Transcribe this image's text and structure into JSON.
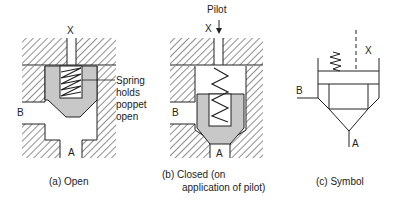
{
  "figures": [
    {
      "id": "a",
      "caption": "(a)  Open",
      "port_labels": {
        "x": "X",
        "b": "B",
        "a": "A"
      },
      "annotation_lines": [
        "Spring",
        "holds",
        "poppet",
        "open"
      ]
    },
    {
      "id": "b",
      "caption_lines": [
        "(b)  Closed (on",
        "application of pilot)"
      ],
      "pilot_label": "Pilot",
      "port_labels": {
        "x": "X",
        "b": "B",
        "a": "A"
      }
    },
    {
      "id": "c",
      "caption": "(c)  Symbol",
      "port_labels": {
        "x": "X",
        "b": "B",
        "a": "A"
      }
    }
  ],
  "colors": {
    "line": "#222222",
    "poppet_fill": "#c8c8c8",
    "background": "#ffffff"
  }
}
